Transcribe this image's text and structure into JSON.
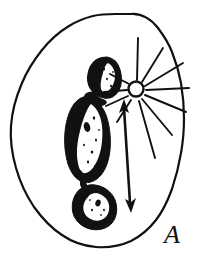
{
  "figure": {
    "panel_label": "A",
    "background_color": "#ffffff",
    "ink_color": "#111111",
    "width": 213,
    "height": 267,
    "caption_text": "",
    "elements": {
      "outer_boundary": {
        "name": "cell-outline",
        "description": "irregular closed organic outline",
        "stroke_width": 2.2,
        "fill": "#ffffff"
      },
      "dark_structure": {
        "name": "shaded-organelle",
        "description": "elongated dark stippled body with pale interior",
        "fill": "#111111",
        "highlight_fill": "#ffffff"
      },
      "lower_blob": {
        "name": "lower-rounded-body",
        "description": "rounded dark body with pale center",
        "fill": "#111111",
        "highlight_fill": "#ffffff"
      },
      "sun": {
        "name": "sun-symbol",
        "description": "open circle with radiating straight rays",
        "center_x": 136,
        "center_y": 89,
        "radius": 7.5,
        "ray_count": 11,
        "stroke_width": 2.0
      },
      "arrow": {
        "name": "double-headed-arrow",
        "description": "vertical arrow with head up toward sun and head down",
        "top_x": 124,
        "top_y": 103,
        "bottom_x": 131,
        "bottom_y": 212,
        "stroke_width": 2.6
      }
    }
  }
}
